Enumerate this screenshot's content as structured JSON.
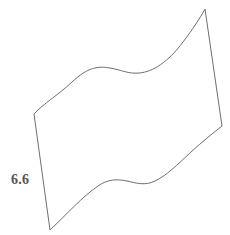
{
  "figure": {
    "name": "wavy-quadrilateral",
    "background_color": "#ffffff",
    "stroke_color": "#6f6f6f",
    "stroke_width": 1,
    "fill": "none",
    "vertices": {
      "left": [
        34,
        114
      ],
      "bottom_left": [
        50,
        230
      ],
      "right": [
        222,
        126
      ],
      "top_right": [
        205,
        9
      ]
    },
    "paths": {
      "outline": "M 34 114 C 44 103 57 96 72 82 C 88 67 98 66 110 68 C 122 70 128 74 139 73 C 153 72 168 62 183 42 C 193 29 200 18 205 9 L 222 126 C 213 133 202 142 191 152 C 177 165 166 176 155 181 C 145 186 136 183 127 181 C 117 179 108 179 98 186 C 83 196 66 215 50 230 Z"
    },
    "labels": [
      {
        "id": "left-side-length",
        "text": "6.6",
        "color": "#555555",
        "x": 11,
        "y": 173,
        "bold": true,
        "refers_to": "left-side"
      }
    ]
  },
  "chart_data": {
    "type": "diagram",
    "title": "",
    "shape": "wavy quadrilateral",
    "measurements": [
      {
        "side": "left",
        "value": 6.6,
        "label": "6.6",
        "units": ""
      }
    ]
  }
}
